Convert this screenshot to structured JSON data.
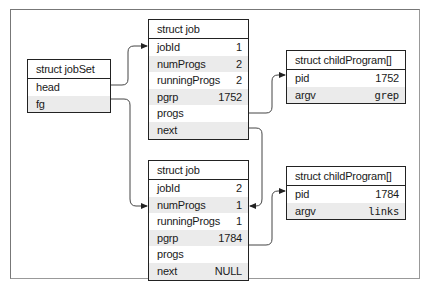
{
  "diagram": {
    "jobSet": {
      "title": "struct jobSet",
      "fields": [
        {
          "name": "head",
          "value": ""
        },
        {
          "name": "fg",
          "value": ""
        }
      ]
    },
    "jobs": [
      {
        "title": "struct job",
        "fields": [
          {
            "name": "jobId",
            "value": "1"
          },
          {
            "name": "numProgs",
            "value": "2"
          },
          {
            "name": "runningProgs",
            "value": "2"
          },
          {
            "name": "pgrp",
            "value": "1752"
          },
          {
            "name": "progs",
            "value": ""
          },
          {
            "name": "next",
            "value": ""
          }
        ]
      },
      {
        "title": "struct job",
        "fields": [
          {
            "name": "jobId",
            "value": "2"
          },
          {
            "name": "numProgs",
            "value": "1"
          },
          {
            "name": "runningProgs",
            "value": "1"
          },
          {
            "name": "pgrp",
            "value": "1784"
          },
          {
            "name": "progs",
            "value": ""
          },
          {
            "name": "next",
            "value": "NULL"
          }
        ]
      }
    ],
    "childPrograms": [
      {
        "title": "struct childProgram[]",
        "fields": [
          {
            "name": "pid",
            "value": "1752"
          },
          {
            "name": "argv",
            "value": "grep"
          }
        ]
      },
      {
        "title": "struct childProgram[]",
        "fields": [
          {
            "name": "pid",
            "value": "1784"
          },
          {
            "name": "argv",
            "value": "links"
          }
        ]
      }
    ],
    "links": [
      {
        "from": "jobSet.head",
        "to": "jobs.0"
      },
      {
        "from": "jobSet.fg",
        "to": "jobs.1"
      },
      {
        "from": "jobs.0.progs",
        "to": "childPrograms.0"
      },
      {
        "from": "jobs.0.next",
        "to": "jobs.1"
      },
      {
        "from": "jobs.1.progs",
        "to": "childPrograms.1"
      }
    ],
    "colors": {
      "border": "#222222",
      "shade": "#ebebeb",
      "frame": "#888888"
    }
  }
}
